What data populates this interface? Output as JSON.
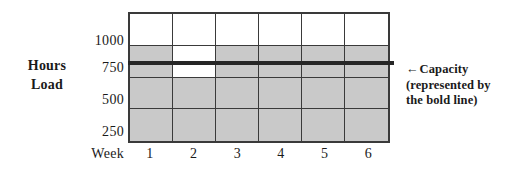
{
  "chart_data": {
    "type": "bar",
    "title": "",
    "subtitle": "",
    "xlabel": "Week",
    "ylabel": "Hours Load",
    "ylabel_lines": [
      "Hours",
      "Load"
    ],
    "categories": [
      "1",
      "2",
      "3",
      "4",
      "5",
      "6"
    ],
    "yticks": [
      1000,
      750,
      500,
      250
    ],
    "ytick_labels": [
      "1000",
      "750",
      "500",
      "250"
    ],
    "ylim": [
      0,
      1000
    ],
    "grid": true,
    "legend_position": "right",
    "band_size": 250,
    "bands": [
      {
        "label": "250",
        "low": 0,
        "high": 250
      },
      {
        "label": "500",
        "low": 250,
        "high": 500
      },
      {
        "label": "750",
        "low": 500,
        "high": 750
      },
      {
        "label": "1000",
        "low": 750,
        "high": 1000
      }
    ],
    "series": [
      {
        "name": "Load",
        "values": [
          750,
          500,
          750,
          750,
          750,
          750
        ],
        "shaded_cells": [
          [
            true,
            true,
            true,
            true,
            true,
            true
          ],
          [
            true,
            true,
            true,
            true,
            true,
            true
          ],
          [
            true,
            false,
            true,
            true,
            true,
            true
          ],
          [
            false,
            false,
            false,
            false,
            false,
            false
          ]
        ]
      }
    ],
    "capacity": {
      "value": 625,
      "style": "bold line",
      "label": "Capacity",
      "note_lines": [
        "(represented by",
        "the bold line)"
      ],
      "arrow": "←"
    },
    "colors": {
      "shade": "#c9c9c9",
      "grid_line": "#3a3a3a",
      "capacity_line": "#262626",
      "background": "#ffffff",
      "text": "#1a1a1a"
    }
  },
  "annotation": {
    "arrow_icon": "←",
    "line1": "Capacity",
    "line2": "(represented by",
    "line3": "the bold line)"
  }
}
